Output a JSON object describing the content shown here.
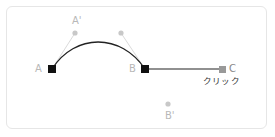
{
  "diagram": {
    "points": {
      "A": {
        "label": "A",
        "x": 52,
        "y": 69,
        "kind": "anchor"
      },
      "B": {
        "label": "B",
        "x": 145,
        "y": 69,
        "kind": "anchor"
      },
      "C": {
        "label": "C",
        "x": 222,
        "y": 69,
        "kind": "new-point"
      },
      "A_handle": {
        "label": "A'",
        "x": 75,
        "y": 33,
        "kind": "control"
      },
      "B_handle_in": {
        "label": "",
        "x": 121,
        "y": 33,
        "kind": "control"
      },
      "B_handle_out": {
        "label": "B'",
        "x": 168,
        "y": 104,
        "kind": "control"
      }
    },
    "labels": {
      "a": "A",
      "b": "B",
      "c": "C",
      "a_prime": "A'",
      "b_prime": "B'",
      "click": "クリック"
    },
    "colors": {
      "anchor": "#111111",
      "new_point": "#999999",
      "control": "#c8c8c8",
      "handle_line": "#d0d0d0",
      "curve": "#222222",
      "label": "#b8b8b8",
      "click_text": "#333333",
      "frame_border": "#e6e6e6"
    }
  }
}
